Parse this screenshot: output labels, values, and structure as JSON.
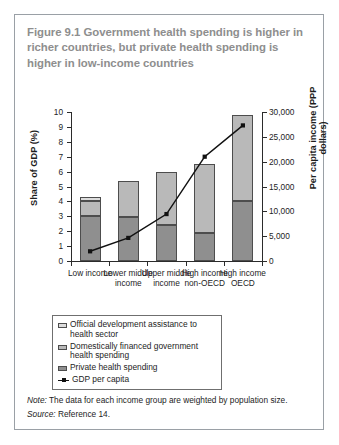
{
  "figure": {
    "title": "Figure 9.1  Government health spending is higher in richer countries, but private health spending is higher in low-income countries",
    "note_label": "Note:",
    "note_text": " The data for each income group are weighted by population size.",
    "source_label": "Source:",
    "source_text": " Reference 14."
  },
  "legend": {
    "items": [
      {
        "key": "oda",
        "label": "Official development assistance to health sector",
        "color": "#dcdcdc"
      },
      {
        "key": "gov",
        "label": "Domestically financed government health spending",
        "color": "#b9b9b9"
      },
      {
        "key": "private",
        "label": "Private health spending",
        "color": "#8f8f8f"
      },
      {
        "key": "gdp",
        "label": "GDP per capita",
        "color": "#111111"
      }
    ]
  },
  "chart_data": {
    "type": "bar",
    "title": "Figure 9.1  Government health spending is higher in richer countries, but private health spending is higher in low-income countries",
    "categories": [
      "Low income",
      "Lower middle income",
      "Upper middle income",
      "High income non-OECD",
      "High income OECD"
    ],
    "xlabel": "",
    "ylabel": "Share of GDP (%)",
    "ylabel_secondary": "Per capita income (PPP dollars)",
    "ylim": [
      0,
      10
    ],
    "yticks": [
      0,
      1,
      2,
      3,
      4,
      5,
      6,
      7,
      8,
      9,
      10
    ],
    "ylim_secondary": [
      0,
      30000
    ],
    "yticks_secondary": [
      0,
      5000,
      10000,
      15000,
      20000,
      25000,
      30000
    ],
    "ytick_labels_secondary": [
      "0",
      "5,000",
      "10,000",
      "15,000",
      "20,000",
      "25,000",
      "30,000"
    ],
    "grid": false,
    "legend_position": "below-plot",
    "stacked": true,
    "series": [
      {
        "name": "Private health spending",
        "axis": "left",
        "values": [
          3.05,
          2.95,
          2.4,
          1.9,
          4.0
        ]
      },
      {
        "name": "Domestically financed government health spending",
        "axis": "left",
        "values": [
          1.0,
          2.45,
          3.55,
          4.6,
          5.8
        ]
      },
      {
        "name": "Official development assistance to health sector",
        "axis": "left",
        "values": [
          0.25,
          0.0,
          0.0,
          0.0,
          0.0
        ]
      }
    ],
    "totals": [
      4.3,
      5.4,
      5.95,
      6.5,
      9.8
    ],
    "line_series": {
      "name": "GDP per capita",
      "axis": "right",
      "values": [
        1950,
        4650,
        9450,
        21000,
        27300
      ],
      "marker": "square",
      "color": "#111111"
    }
  },
  "axes": {
    "left_ticks": [
      "10",
      "9",
      "8",
      "7",
      "6",
      "5",
      "4",
      "3",
      "2",
      "1",
      "0"
    ],
    "right_ticks": [
      "30,000",
      "25,000",
      "20,000",
      "15,000",
      "10,000",
      "5,000",
      "0"
    ]
  }
}
